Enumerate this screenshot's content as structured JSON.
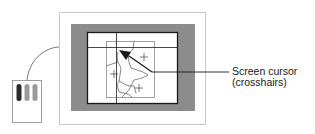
{
  "diagram": {
    "type": "digitizer-screen-cursor-illustration",
    "callout": {
      "line1": "Screen cursor",
      "line2": "(crosshairs)"
    },
    "components": {
      "monitor_frame": "monitor-outline",
      "bezel": "monitor-bezel",
      "screen": "display-screen",
      "crosshair_cursor": "crosshair-cursor",
      "drawing": "map-drawing-with-plus-markers",
      "pointer": "arrow-pointer",
      "input_device": "digitizer-puck",
      "cable": "puck-cable"
    },
    "puck_buttons": [
      {
        "name": "button-1",
        "color": "#2a2a2a"
      },
      {
        "name": "button-2",
        "color": "#9a9a9a"
      },
      {
        "name": "button-3",
        "color": "#9a9a9a"
      }
    ],
    "colors": {
      "bezel": "#8c8c8c",
      "frame_outline": "#c8c8c8",
      "screen_border": "#1a1a1a",
      "lines": "#333333"
    }
  }
}
